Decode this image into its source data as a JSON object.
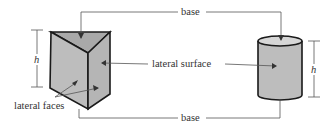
{
  "diagram": {
    "labels": {
      "base_top": "base",
      "base_bottom": "base",
      "lateral_surface": "lateral surface",
      "lateral_faces": "lateral faces",
      "height_left": "h",
      "height_right": "h"
    },
    "colors": {
      "fill": "#b8b8b8",
      "top_fill": "#a9a9a9",
      "outline": "#1a1a1a",
      "leader": "#555555"
    }
  }
}
